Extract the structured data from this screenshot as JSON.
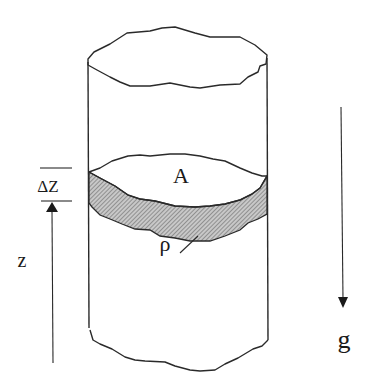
{
  "diagram": {
    "type": "fluid column slab",
    "labels": {
      "area": "A",
      "density": "ρ",
      "height": "z",
      "thickness": "ΔZ",
      "gravity": "g"
    },
    "colors": {
      "line": "#2a2a2a",
      "slab_fill": "#9a9a9a",
      "background": "#ffffff"
    }
  }
}
